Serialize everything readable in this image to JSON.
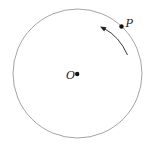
{
  "diagram": {
    "type": "circle-motion",
    "circle": {
      "cx": 77.5,
      "cy": 73.5,
      "r": 64.5,
      "stroke": "#9a9a9a"
    },
    "center_point": {
      "label": "O",
      "x": 77,
      "y": 74,
      "label_x": 66,
      "label_y": 79
    },
    "moving_point": {
      "label": "P",
      "x": 121.5,
      "y": 26.5,
      "label_x": 126,
      "label_y": 26
    },
    "motion_arrow": {
      "direction": "counterclockwise",
      "color": "#222222"
    },
    "colors": {
      "dot": "#111111",
      "circle": "#9a9a9a",
      "arrow": "#222222",
      "text": "#222222"
    }
  }
}
